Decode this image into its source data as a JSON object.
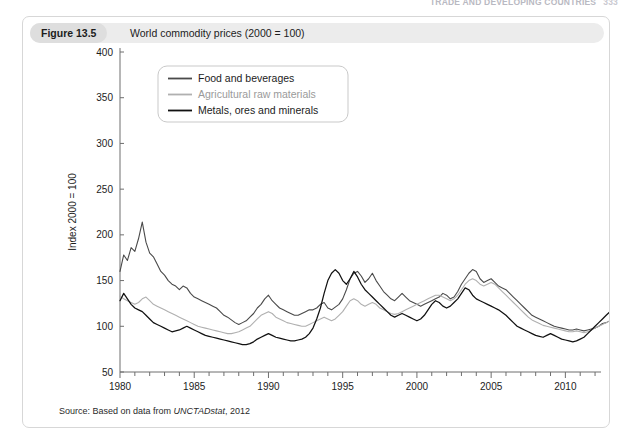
{
  "running_header": {
    "text": "TRADE AND DEVELOPING COUNTRIES",
    "page": "333"
  },
  "figure": {
    "number_label": "Figure 13.5",
    "caption": "World commodity prices (2000 = 100)"
  },
  "source": {
    "prefix": "Source: Based on data from ",
    "italic": "UNCTADstat",
    "suffix": ", 2012"
  },
  "colors": {
    "food": "#4a4a4a",
    "agri": "#b0b0b0",
    "metals": "#111111",
    "axis": "#6e6e6e",
    "text": "#1c1c1c",
    "caption_bar": "#ececec",
    "chip": "#dedede",
    "card_border": "#d7d7d7"
  },
  "chart_data": {
    "type": "line",
    "title": "World commodity prices (2000 = 100)",
    "xlabel": "",
    "ylabel": "Index 2000 = 100",
    "xlim": [
      1980,
      2012.4
    ],
    "ylim": [
      50,
      400
    ],
    "ytick_values": [
      50,
      100,
      150,
      200,
      250,
      300,
      350,
      400
    ],
    "ytick_labels": [
      "50",
      "100",
      "150",
      "200",
      "250",
      "300",
      "350",
      "400"
    ],
    "xtick_major_values": [
      1980,
      1985,
      1990,
      1995,
      2000,
      2005,
      2010
    ],
    "xtick_major_labels": [
      "1980",
      "1985",
      "1990",
      "1995",
      "2000",
      "2005",
      "2010"
    ],
    "xtick_minor_step": 1,
    "grid": false,
    "legend_position": "top-left-inside",
    "legend": [
      {
        "name": "Food and beverages",
        "color": "#4a4a4a"
      },
      {
        "name": "Agricultural raw materials",
        "color": "#b0b0b0"
      },
      {
        "name": "Metals, ores and minerals",
        "color": "#111111"
      }
    ],
    "x_start": 1980.0,
    "x_step": 0.25,
    "series": [
      {
        "name": "Food and beverages",
        "color": "#4a4a4a",
        "values": [
          160,
          178,
          172,
          186,
          182,
          196,
          214,
          192,
          180,
          176,
          168,
          160,
          156,
          150,
          146,
          144,
          140,
          144,
          142,
          136,
          132,
          130,
          128,
          126,
          124,
          122,
          120,
          116,
          112,
          110,
          107,
          104,
          102,
          104,
          106,
          110,
          114,
          120,
          124,
          130,
          134,
          128,
          124,
          120,
          118,
          116,
          114,
          112,
          112,
          114,
          116,
          118,
          118,
          120,
          124,
          126,
          120,
          118,
          121,
          124,
          130,
          140,
          152,
          158,
          160,
          155,
          148,
          152,
          158,
          150,
          144,
          138,
          134,
          130,
          128,
          132,
          136,
          132,
          128,
          126,
          124,
          122,
          124,
          126,
          128,
          130,
          132,
          136,
          134,
          130,
          132,
          138,
          146,
          152,
          158,
          162,
          160,
          152,
          148,
          150,
          152,
          148,
          144,
          142,
          140,
          136,
          132,
          128,
          124,
          120,
          116,
          112,
          110,
          108,
          106,
          104,
          102,
          100,
          99,
          98,
          97,
          96,
          96,
          97,
          96,
          95,
          96,
          97,
          98,
          100,
          103,
          104,
          106,
          110,
          116,
          122,
          128,
          132,
          130,
          134,
          140,
          148,
          158,
          170,
          182,
          196,
          212,
          228,
          240,
          248,
          252,
          258,
          262,
          268,
          276,
          284,
          292,
          300,
          312,
          328,
          352,
          376,
          391,
          370,
          340,
          300,
          248,
          208,
          190,
          184,
          196,
          212,
          232,
          252,
          268,
          284,
          300,
          318,
          332,
          346,
          360,
          372,
          368,
          356,
          344,
          352,
          364,
          358,
          342,
          326,
          312,
          302,
          296,
          294
        ]
      },
      {
        "name": "Agricultural raw materials",
        "color": "#b0b0b0",
        "values": [
          133,
          130,
          128,
          126,
          124,
          126,
          130,
          132,
          128,
          124,
          122,
          120,
          118,
          116,
          114,
          112,
          110,
          108,
          106,
          104,
          102,
          100,
          99,
          98,
          97,
          96,
          95,
          94,
          93,
          92,
          92,
          93,
          94,
          96,
          98,
          100,
          104,
          108,
          112,
          114,
          116,
          114,
          110,
          108,
          106,
          104,
          103,
          102,
          101,
          100,
          100,
          102,
          104,
          106,
          108,
          110,
          108,
          106,
          108,
          112,
          116,
          122,
          128,
          130,
          128,
          124,
          122,
          124,
          126,
          124,
          120,
          118,
          116,
          114,
          113,
          114,
          116,
          118,
          120,
          122,
          124,
          126,
          128,
          130,
          132,
          134,
          134,
          132,
          130,
          128,
          130,
          134,
          140,
          146,
          150,
          152,
          150,
          146,
          144,
          146,
          148,
          146,
          142,
          138,
          134,
          130,
          126,
          122,
          118,
          114,
          110,
          107,
          105,
          103,
          101,
          100,
          99,
          98,
          97,
          96,
          95,
          94,
          94,
          95,
          94,
          93,
          94,
          96,
          98,
          100,
          102,
          104,
          106,
          108,
          112,
          116,
          120,
          124,
          126,
          128,
          132,
          136,
          142,
          148,
          154,
          160,
          166,
          172,
          178,
          182,
          186,
          190,
          194,
          198,
          204,
          210,
          216,
          222,
          230,
          242,
          254,
          262,
          266,
          252,
          232,
          208,
          180,
          152,
          140,
          138,
          148,
          162,
          178,
          192,
          204,
          216,
          228,
          240,
          250,
          262,
          272,
          282,
          296,
          306,
          300,
          288,
          276,
          268,
          262,
          254,
          246,
          238,
          226,
          200
        ]
      },
      {
        "name": "Metals, ores and minerals",
        "color": "#111111",
        "values": [
          128,
          136,
          130,
          124,
          120,
          118,
          116,
          112,
          108,
          104,
          102,
          100,
          98,
          96,
          94,
          95,
          96,
          98,
          100,
          98,
          96,
          94,
          92,
          90,
          89,
          88,
          87,
          86,
          85,
          84,
          83,
          82,
          81,
          80,
          80,
          81,
          83,
          86,
          88,
          90,
          92,
          90,
          88,
          87,
          86,
          85,
          84,
          84,
          85,
          86,
          88,
          92,
          98,
          108,
          120,
          136,
          150,
          158,
          162,
          158,
          150,
          146,
          152,
          160,
          154,
          146,
          140,
          136,
          132,
          128,
          124,
          120,
          116,
          112,
          110,
          112,
          114,
          112,
          110,
          108,
          106,
          108,
          112,
          118,
          124,
          128,
          126,
          122,
          120,
          122,
          126,
          130,
          136,
          142,
          140,
          134,
          130,
          128,
          126,
          124,
          122,
          120,
          118,
          115,
          112,
          108,
          104,
          100,
          98,
          96,
          94,
          92,
          90,
          89,
          88,
          90,
          92,
          90,
          88,
          86,
          85,
          84,
          83,
          84,
          86,
          88,
          92,
          96,
          100,
          104,
          108,
          112,
          116,
          122,
          128,
          134,
          140,
          146,
          148,
          152,
          158,
          166,
          176,
          188,
          202,
          218,
          236,
          252,
          268,
          278,
          284,
          290,
          296,
          302,
          308,
          312,
          318,
          324,
          332,
          342,
          356,
          368,
          372,
          352,
          318,
          272,
          222,
          176,
          158,
          154,
          166,
          182,
          200,
          216,
          230,
          244,
          256,
          266,
          272,
          278,
          282,
          286,
          282,
          274,
          266,
          258,
          250,
          244,
          238,
          234,
          236,
          244,
          256,
          274
        ]
      }
    ]
  }
}
